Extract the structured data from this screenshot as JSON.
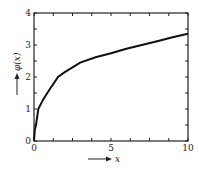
{
  "chart_data": {
    "type": "line",
    "title": "",
    "xlabel": "x",
    "ylabel": "φ(x)",
    "xlim": [
      0,
      10
    ],
    "ylim": [
      0,
      4
    ],
    "x_ticks": [
      "0",
      "5",
      "10"
    ],
    "y_ticks": [
      "0",
      "1",
      "2",
      "3",
      "4"
    ],
    "grid": false,
    "legend": null,
    "series": [
      {
        "name": "φ(x)",
        "x": [
          0,
          0.05,
          0.13,
          0.28,
          0.6,
          1.0,
          1.56,
          2.0,
          3.0,
          4.0,
          5.0,
          6.0,
          7.0,
          8.0,
          9.0,
          10.0
        ],
        "values": [
          0,
          0.35,
          0.5,
          1.0,
          1.3,
          1.6,
          2.0,
          2.15,
          2.45,
          2.62,
          2.74,
          2.88,
          3.0,
          3.12,
          3.24,
          3.35
        ]
      }
    ]
  }
}
